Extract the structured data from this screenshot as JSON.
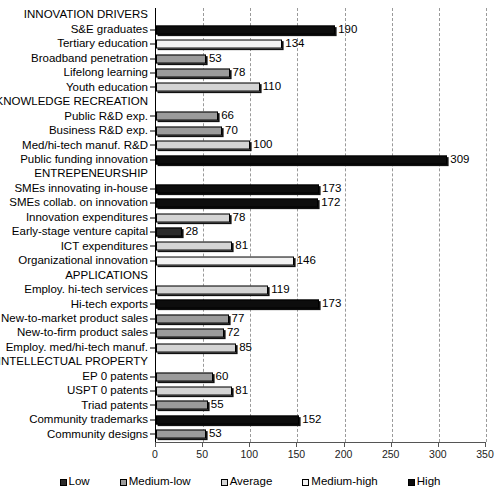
{
  "chart_data": {
    "type": "bar",
    "orientation": "horizontal",
    "title": "",
    "xlabel": "",
    "ylabel": "",
    "xlim": [
      0,
      350
    ],
    "xticks": [
      0,
      50,
      100,
      150,
      200,
      250,
      300,
      350
    ],
    "grid": true,
    "legend_position": "bottom",
    "categories": [
      "INNOVATION DRIVERS",
      "S&E graduates",
      "Tertiary education",
      "Broadband penetration",
      "Lifelong learning",
      "Youth education",
      "KNOWLEDGE RECREATION",
      "Public R&D exp.",
      "Business R&D exp.",
      "Med/hi-tech manuf. R&D",
      "Public funding innovation",
      "ENTREPENEURSHIP",
      "SMEs innovating in-house",
      "SMEs collab. on innovation",
      "Innovation expenditures",
      "Early-stage venture capital",
      "ICT expenditures",
      "Organizational innovation",
      "APPLICATIONS",
      "Employ. hi-tech services",
      "Hi-tech exports",
      "New-to-market product sales",
      "New-to-firm product sales",
      "Employ. med/hi-tech manuf.",
      "INTELLECTUAL PROPERTY",
      "EP 0 patents",
      "USPT 0 patents",
      "Triad patents",
      "Community trademarks",
      "Community designs"
    ],
    "values": [
      null,
      190,
      134,
      53,
      78,
      110,
      null,
      66,
      70,
      100,
      309,
      null,
      173,
      172,
      78,
      28,
      81,
      146,
      null,
      119,
      173,
      77,
      72,
      85,
      null,
      60,
      81,
      55,
      152,
      53
    ],
    "levels": [
      null,
      "High",
      "Medium-high",
      "Medium-low",
      "Medium-low",
      "Average",
      null,
      "Medium-low",
      "Medium-low",
      "Average",
      "High",
      null,
      "High",
      "High",
      "Average",
      "Low",
      "Average",
      "Medium-high",
      null,
      "Average",
      "High",
      "Medium-low",
      "Medium-low",
      "Average",
      null,
      "Medium-low",
      "Average",
      "Medium-low",
      "High",
      "Medium-low"
    ],
    "is_section_header": [
      true,
      false,
      false,
      false,
      false,
      false,
      true,
      false,
      false,
      false,
      false,
      true,
      false,
      false,
      false,
      false,
      false,
      false,
      true,
      false,
      false,
      false,
      false,
      false,
      true,
      false,
      false,
      false,
      false,
      false
    ],
    "legend": [
      {
        "label": "Low",
        "color": "#2b2b2b"
      },
      {
        "label": "Medium-low",
        "color": "#9b9b9b"
      },
      {
        "label": "Average",
        "color": "#d4d4d4"
      },
      {
        "label": "Medium-high",
        "color": "#f2f2f2"
      },
      {
        "label": "High",
        "color": "#0d0d0d"
      }
    ],
    "level_colors": {
      "Low": "#2b2b2b",
      "Medium-low": "#9b9b9b",
      "Average": "#d4d4d4",
      "Medium-high": "#f2f2f2",
      "High": "#0d0d0d"
    }
  }
}
